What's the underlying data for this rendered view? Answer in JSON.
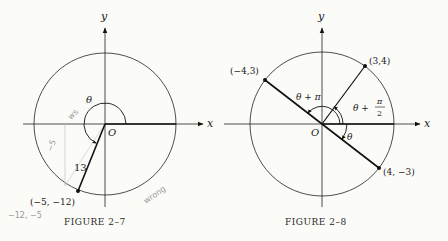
{
  "figures": [
    {
      "caption": "FIGURE 2–7",
      "axis_x_label": "x",
      "axis_y_label": "y",
      "origin_label": "O",
      "angle_label": "θ",
      "radius_label": "13",
      "point_label": "(−5, −12)",
      "handwritten": {
        "side_label": "−5",
        "angle_note": "wrong",
        "coord_note": "−12, −5",
        "arc_note": "ws"
      }
    },
    {
      "caption": "FIGURE 2–8",
      "axis_x_label": "x",
      "axis_y_label": "y",
      "origin_label": "O",
      "points": [
        {
          "label": "(3,4)"
        },
        {
          "label": "(−4,3)"
        },
        {
          "label": "(4, −3)"
        }
      ],
      "angle_labels": {
        "theta": "θ",
        "theta_plus_pi": "θ + π",
        "theta_plus_half_pi_prefix": "θ +",
        "pi": "π",
        "two": "2"
      }
    }
  ]
}
